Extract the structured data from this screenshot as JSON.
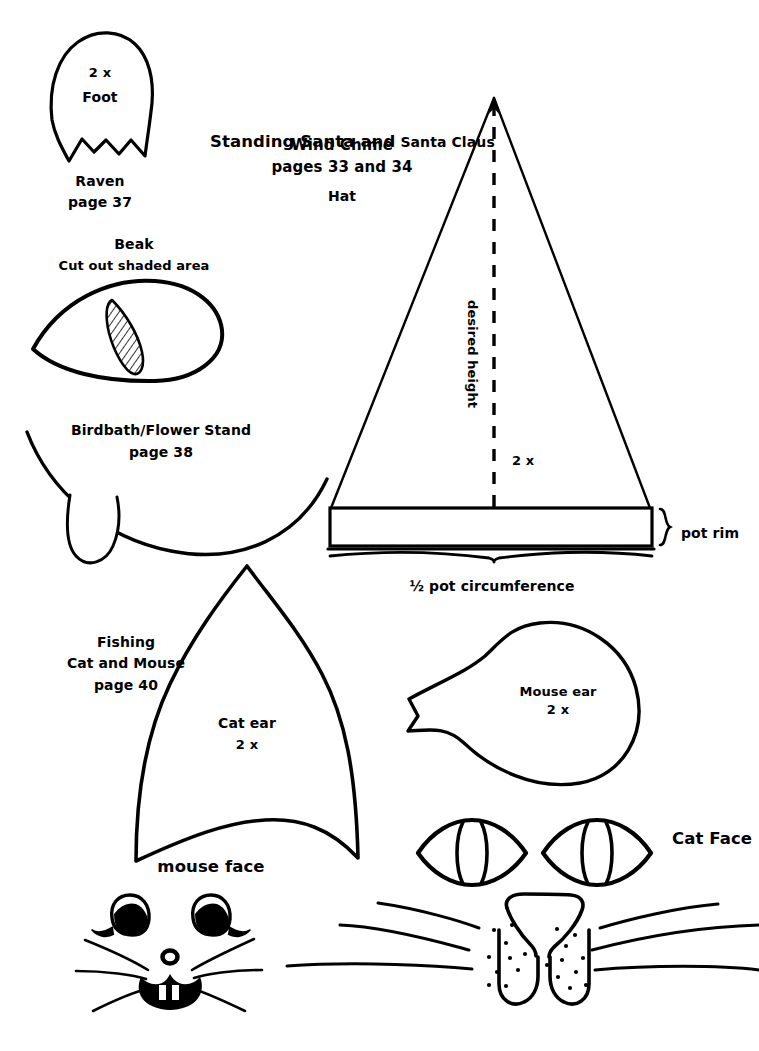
{
  "page": {
    "kind": "craft-pattern-template-sheet",
    "background_color": "#ffffff",
    "ink_color": "#000000",
    "width": 759,
    "height": 1051
  },
  "patterns": {
    "raven_foot": {
      "shape_name": "raven-foot-pattern",
      "quantity_label": "2 x",
      "part_label": "Foot",
      "project_label": "Raven",
      "page_label": "page 37"
    },
    "raven_beak": {
      "shape_name": "raven-beak-pattern",
      "part_label": "Beak",
      "instruction_label": "Cut out shaded area"
    },
    "birdbath": {
      "shape_name": "birdbath-flower-stand-pattern",
      "project_label": "Birdbath/Flower Stand",
      "page_label": "page 38"
    },
    "santa_hat": {
      "shape_name": "santa-hat-cone-pattern",
      "title_line1_strong": "Standing Santa and",
      "title_line1_light": "Santa Claus",
      "title_line2": "Wind Chime",
      "title_line3": "pages 33 and 34",
      "part_label": "Hat",
      "height_label": "desired height",
      "quantity_label": "2 x",
      "rim_label": "pot rim",
      "circumference_label": "½ pot circumference"
    },
    "cat_ear": {
      "shape_name": "cat-ear-pattern",
      "project_label_line1": "Fishing",
      "project_label_line2": "Cat and Mouse",
      "page_label": "page 40",
      "part_label": "Cat ear",
      "quantity_label": "2 x"
    },
    "mouse_ear": {
      "shape_name": "mouse-ear-pattern",
      "part_label": "Mouse ear",
      "quantity_label": "2 x"
    },
    "mouse_face": {
      "shape_name": "mouse-face-pattern",
      "part_label": "mouse face"
    },
    "cat_face": {
      "shape_name": "cat-face-pattern",
      "part_label": "Cat Face"
    }
  }
}
